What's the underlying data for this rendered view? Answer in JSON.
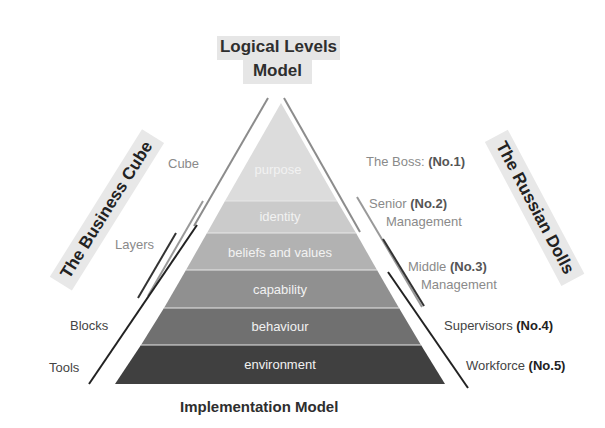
{
  "top_title": {
    "line1": "Logical Levels",
    "line2": "Model"
  },
  "bottom_title": "Implementation Model",
  "left_banner": "The Business Cube",
  "right_banner": "The Russian Dolls",
  "pyramid": {
    "layers": [
      {
        "label": "purpose",
        "color": "#dcdcdc"
      },
      {
        "label": "identity",
        "color": "#cbcbcb"
      },
      {
        "label": "beliefs and values",
        "color": "#b2b2b2"
      },
      {
        "label": "capability",
        "color": "#909090"
      },
      {
        "label": "behaviour",
        "color": "#707070"
      },
      {
        "label": "environment",
        "color": "#404040"
      }
    ]
  },
  "left_labels": {
    "cube": "Cube",
    "layers": "Layers",
    "blocks": "Blocks",
    "tools": "Tools"
  },
  "right_labels": {
    "boss": {
      "text": "The Boss: ",
      "num": "(No.1)"
    },
    "senior": {
      "text": "Senior ",
      "num": "(No.2)",
      "line2": "Management"
    },
    "middle": {
      "text": "Middle ",
      "num": "(No.3)",
      "line2": "Management"
    },
    "supervisors": {
      "text": "Supervisors ",
      "num": "(No.4)"
    },
    "workforce": {
      "text": "Workforce ",
      "num": "(No.5)"
    }
  }
}
